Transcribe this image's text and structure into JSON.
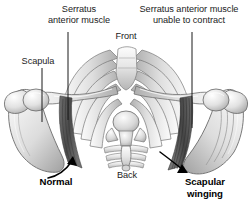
{
  "figure": {
    "background_color": "#ffffff",
    "ink_color": "#1b1b1b",
    "bone_light": "#f2f2f2",
    "bone_mid": "#cfcfcf",
    "bone_shadow": "#9a9a9a",
    "muscle_dark": "#5c5c5c",
    "muscle_darkest": "#3a3a3a"
  },
  "labels": {
    "serratus_normal": "Serratus\nanterior muscle",
    "serratus_weak": "Serratus anterior muscle\nunable to contract",
    "scapula": "Scapula",
    "front": "Front",
    "back": "Back",
    "normal": "Normal",
    "scapular_winging": "Scapular\nwinging"
  },
  "anatomy": {
    "parts": [
      "ribcage",
      "sternum",
      "clavicle-left",
      "clavicle-right",
      "scapula-left-normal",
      "scapula-right-winged",
      "humeral-head-left",
      "humeral-head-right",
      "vertebra",
      "spinous-process",
      "serratus-anterior-left",
      "serratus-anterior-right"
    ],
    "orientation": {
      "anterior": "Front",
      "posterior": "Back",
      "view": "superior axial"
    }
  },
  "leaders": [
    {
      "name": "leader-serratus-normal",
      "from": [
        68,
        32
      ],
      "to": [
        68,
        120
      ]
    },
    {
      "name": "leader-serratus-weak",
      "from": [
        192,
        32
      ],
      "to": [
        192,
        128
      ]
    },
    {
      "name": "leader-scapula",
      "from": [
        42,
        68
      ],
      "to": [
        42,
        122
      ]
    }
  ],
  "arrows": [
    {
      "name": "arrow-normal",
      "points_to": "scapula-left-normal"
    },
    {
      "name": "arrow-scapular-winging",
      "points_to": "scapula-right-winged"
    }
  ]
}
